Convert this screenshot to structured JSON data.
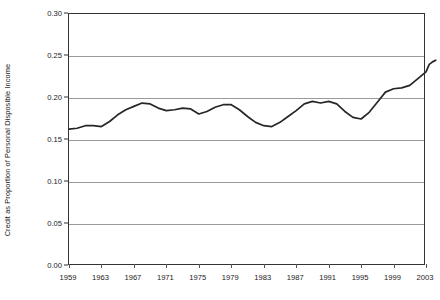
{
  "chart_data": {
    "type": "line",
    "title": "",
    "xlabel": "",
    "ylabel": "Credit as Proportion of Personal Disposible Income",
    "xlim": [
      1959,
      2003
    ],
    "ylim": [
      0.0,
      0.3
    ],
    "grid": true,
    "legend": false,
    "legend_position": "none",
    "y_ticks": [
      "0.00",
      "0.05",
      "0.10",
      "0.15",
      "0.20",
      "0.25",
      "0.30"
    ],
    "y_tick_values": [
      0.0,
      0.05,
      0.1,
      0.15,
      0.2,
      0.25,
      0.3
    ],
    "x_ticks": [
      "1959",
      "1963",
      "1967",
      "1971",
      "1975",
      "1979",
      "1983",
      "1987",
      "1991",
      "1995",
      "1999",
      "2003"
    ],
    "x_tick_values": [
      1959,
      1963,
      1967,
      1971,
      1975,
      1979,
      1983,
      1987,
      1991,
      1995,
      1999,
      2003
    ],
    "series": [
      {
        "name": "Credit as Proportion of Personal Disposible Income",
        "color": "#262626",
        "x": [
          1959,
          1960,
          1961,
          1962,
          1963,
          1964,
          1965,
          1966,
          1967,
          1968,
          1969,
          1970,
          1971,
          1972,
          1973,
          1974,
          1975,
          1976,
          1977,
          1978,
          1979,
          1980,
          1981,
          1982,
          1983,
          1984,
          1985,
          1986,
          1987,
          1988,
          1989,
          1990,
          1991,
          1992,
          1993,
          1994,
          1995,
          1996,
          1997,
          1998,
          1999,
          2000,
          2001,
          2002,
          2003
        ],
        "values": [
          0.163,
          0.164,
          0.167,
          0.167,
          0.166,
          0.172,
          0.18,
          0.186,
          0.19,
          0.194,
          0.193,
          0.188,
          0.185,
          0.186,
          0.188,
          0.187,
          0.181,
          0.184,
          0.189,
          0.192,
          0.192,
          0.186,
          0.178,
          0.171,
          0.167,
          0.166,
          0.171,
          0.178,
          0.185,
          0.193,
          0.196,
          0.194,
          0.196,
          0.193,
          0.184,
          0.177,
          0.175,
          0.183,
          0.195,
          0.207,
          0.211,
          0.212,
          0.215,
          0.223,
          0.231
        ]
      }
    ],
    "series_tail": {
      "x": [
        2003.0,
        2003.4,
        2003.8,
        2004.2
      ],
      "values": [
        0.231,
        0.24,
        0.243,
        0.245
      ]
    }
  }
}
